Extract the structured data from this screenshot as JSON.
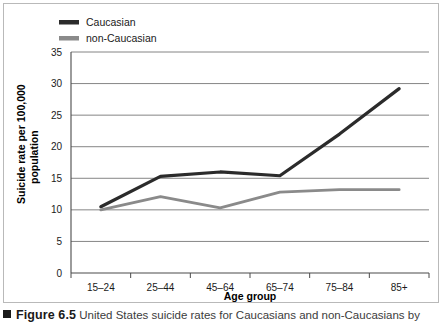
{
  "chart_data": {
    "type": "line",
    "title": "",
    "xlabel": "Age group",
    "ylabel": "Suicide rate per 100,000 population",
    "categories": [
      "15–24",
      "25–44",
      "45–64",
      "65–74",
      "75–84",
      "85+"
    ],
    "ylim": [
      0,
      35
    ],
    "yticks": [
      0,
      5,
      10,
      15,
      20,
      25,
      30,
      35
    ],
    "ytick_labels": [
      "0",
      "5",
      "10",
      "15",
      "20",
      "25",
      "30",
      "35"
    ],
    "grid": true,
    "grid_axis": "y",
    "legend_position": "top-left",
    "series": [
      {
        "name": "Caucasian",
        "color": "#2b2b2b",
        "values": [
          10.5,
          15.3,
          16.0,
          15.4,
          22.0,
          29.2
        ]
      },
      {
        "name": "non-Caucasian",
        "color": "#8a8a8a",
        "values": [
          10.0,
          12.1,
          10.3,
          12.8,
          13.2,
          13.2
        ]
      }
    ]
  },
  "legend": {
    "items": [
      {
        "label": "Caucasian",
        "color": "#2b2b2b"
      },
      {
        "label": "non-Caucasian",
        "color": "#8a8a8a"
      }
    ]
  },
  "axes": {
    "y_title_line1": "Suicide rate per 100,000",
    "y_title_line2": "population",
    "x_title": "Age group"
  },
  "caption": {
    "marker": "■",
    "figure_number": "Figure 6.5",
    "text": "United States suicide rates for Caucasians and non-Caucasians by"
  }
}
